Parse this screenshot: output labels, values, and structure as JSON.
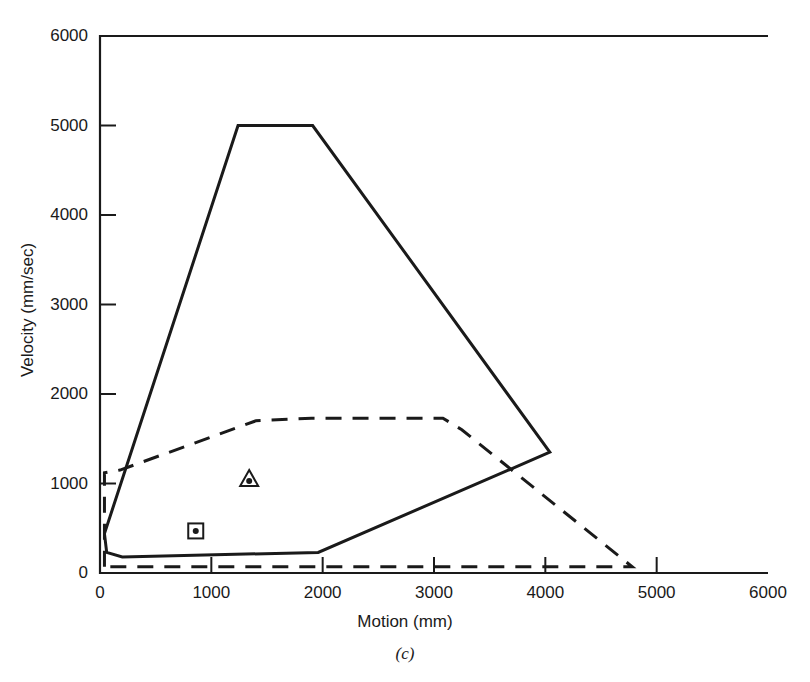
{
  "chart_data": {
    "type": "line",
    "title": "",
    "caption": "(c)",
    "xlabel": "Motion (mm)",
    "ylabel": "Velocity (mm/sec)",
    "xlim": [
      0,
      6000
    ],
    "ylim": [
      0,
      6000
    ],
    "xticks": [
      0,
      1000,
      2000,
      3000,
      4000,
      5000,
      6000
    ],
    "yticks": [
      0,
      1000,
      2000,
      3000,
      4000,
      5000,
      6000
    ],
    "xtick_labels": [
      "0",
      "1000",
      "2000",
      "3000",
      "4000",
      "5000",
      "6000"
    ],
    "ytick_labels": [
      "0",
      "1000",
      "2000",
      "3000",
      "4000",
      "5000",
      "6000"
    ],
    "grid": false,
    "legend": "none",
    "series": [
      {
        "name": "solid-envelope",
        "style": "solid",
        "color": "#1a1a1a",
        "closed": true,
        "points": [
          [
            40,
            440
          ],
          [
            60,
            230
          ],
          [
            200,
            180
          ],
          [
            1960,
            230
          ],
          [
            4040,
            1350
          ],
          [
            1910,
            5000
          ],
          [
            1240,
            5000
          ],
          [
            40,
            440
          ]
        ]
      },
      {
        "name": "dashed-envelope",
        "style": "dashed",
        "color": "#1a1a1a",
        "closed": true,
        "points": [
          [
            40,
            70
          ],
          [
            40,
            1120
          ],
          [
            180,
            1150
          ],
          [
            1400,
            1700
          ],
          [
            1900,
            1730
          ],
          [
            3080,
            1730
          ],
          [
            3250,
            1600
          ],
          [
            4780,
            70
          ],
          [
            40,
            70
          ]
        ]
      }
    ],
    "markers": [
      {
        "name": "triangle-dot-marker",
        "shape": "triangle",
        "x": 1340,
        "y": 1050
      },
      {
        "name": "square-dot-marker",
        "shape": "square",
        "x": 860,
        "y": 470
      }
    ]
  }
}
